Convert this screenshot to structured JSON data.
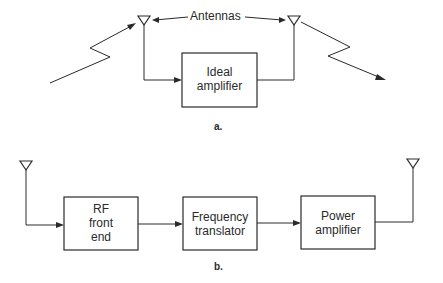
{
  "diagram_a": {
    "caption": "a.",
    "annotation": "Antennas",
    "box": {
      "line1": "Ideal",
      "line2": "amplifier"
    }
  },
  "diagram_b": {
    "caption": "b.",
    "boxes": [
      {
        "line1": "RF",
        "line2": "front",
        "line3": "end"
      },
      {
        "line1": "Frequency",
        "line2": "translator"
      },
      {
        "line1": "Power",
        "line2": "amplifier"
      }
    ]
  }
}
